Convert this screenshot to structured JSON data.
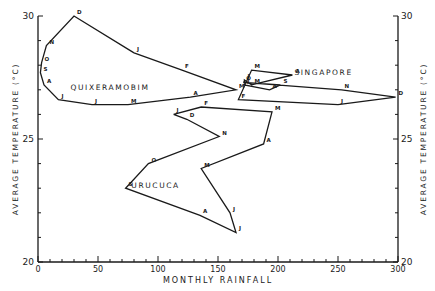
{
  "chart_data": {
    "type": "line",
    "title": "",
    "xlabel": "MONTHLY RAINFALL",
    "ylabel": "AVERAGE TEMPERATURE (°C)",
    "ylabel_right": "AVERAGE TEMPERATURE (°C)",
    "xlim": [
      0,
      300
    ],
    "ylim": [
      20,
      30
    ],
    "x_ticks": [
      0,
      50,
      100,
      150,
      200,
      250,
      300
    ],
    "y_ticks": [
      20,
      25,
      30
    ],
    "grid": false,
    "legend": "none (series labeled inline)",
    "series": [
      {
        "name": "QUIXERAMOBIM",
        "months": [
          "J",
          "F",
          "M",
          "A",
          "M",
          "J",
          "J",
          "A",
          "S",
          "O",
          "N",
          "D",
          "J"
        ],
        "x": [
          80,
          120,
          165,
          127,
          75,
          45,
          17,
          5,
          2,
          3,
          7,
          30,
          80
        ],
        "y": [
          28.5,
          27.8,
          27.0,
          26.7,
          26.4,
          26.4,
          26.6,
          27.2,
          27.7,
          28.1,
          28.8,
          30.0,
          28.5
        ],
        "label_pos": {
          "x": 60,
          "y": 27.0
        }
      },
      {
        "name": "URUCUCA",
        "months": [
          "J",
          "F",
          "M",
          "A",
          "M",
          "J",
          "J",
          "A",
          "S",
          "O",
          "N",
          "D",
          "J"
        ],
        "x": [
          113,
          136,
          195,
          188,
          136,
          160,
          165,
          135,
          73,
          92,
          151,
          124,
          113
        ],
        "y": [
          26.0,
          26.3,
          26.1,
          24.8,
          23.8,
          22.0,
          21.2,
          21.9,
          23.0,
          24.0,
          25.1,
          25.8,
          26.0
        ],
        "label_pos": {
          "x": 98,
          "y": 23.0
        }
      },
      {
        "name": "SINGAPORE",
        "months": [
          "J",
          "F",
          "M",
          "A",
          "M",
          "J",
          "J",
          "A",
          "S",
          "O",
          "N",
          "D",
          "J"
        ],
        "x": [
          250,
          167,
          178,
          212,
          178,
          172,
          172,
          193,
          202,
          171,
          253,
          298,
          250
        ],
        "y": [
          26.4,
          26.6,
          27.8,
          27.6,
          27.2,
          27.4,
          27.2,
          27.0,
          27.2,
          27.3,
          27.0,
          26.7,
          26.4
        ],
        "label_pos": {
          "x": 238,
          "y": 27.6
        }
      }
    ],
    "annotations": [
      "direction arrow near Quixeramobim J (Jan→Feb)",
      "direction arrow near Urucuca J (Jan→Feb)",
      "direction arrow near Singapore J (Dec→Jan)"
    ]
  }
}
